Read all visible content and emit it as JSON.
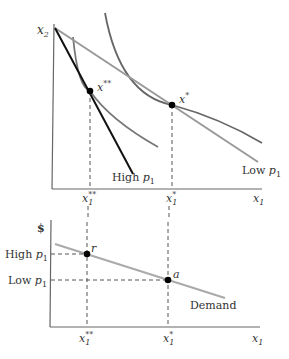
{
  "top_panel": {
    "y_axis_label": "x",
    "y_axis_sub": "2",
    "x_axis_label": "x",
    "x_axis_sub": "1",
    "point_double_star": {
      "label": "x",
      "sup": "**"
    },
    "point_star": {
      "label": "x",
      "sup": "*"
    },
    "budget_high": {
      "label": "High ",
      "p": "p",
      "sub": "1"
    },
    "budget_low": {
      "label": "Low ",
      "p": "p",
      "sub": "1"
    },
    "tick_double_star": {
      "label": "x",
      "sub": "1",
      "sup": "**"
    },
    "tick_star": {
      "label": "x",
      "sub": "1",
      "sup": "*"
    }
  },
  "bottom_panel": {
    "y_axis_label": "$",
    "x_axis_label": "x",
    "x_axis_sub": "1",
    "price_high": {
      "label": "High ",
      "p": "p",
      "sub": "1"
    },
    "price_low": {
      "label": "Low ",
      "p": "p",
      "sub": "1"
    },
    "point_r": "r",
    "point_a": "a",
    "demand_label": "Demand",
    "tick_double_star": {
      "label": "x",
      "sub": "1",
      "sup": "**"
    },
    "tick_star": {
      "label": "x",
      "sub": "1",
      "sup": "*"
    }
  },
  "colors": {
    "axis": "#555555",
    "budget_high": "#111111",
    "budget_low": "#999999",
    "indifference": "#666666",
    "demand": "#aaaaaa",
    "point": "#000000",
    "dash": "#555555"
  }
}
